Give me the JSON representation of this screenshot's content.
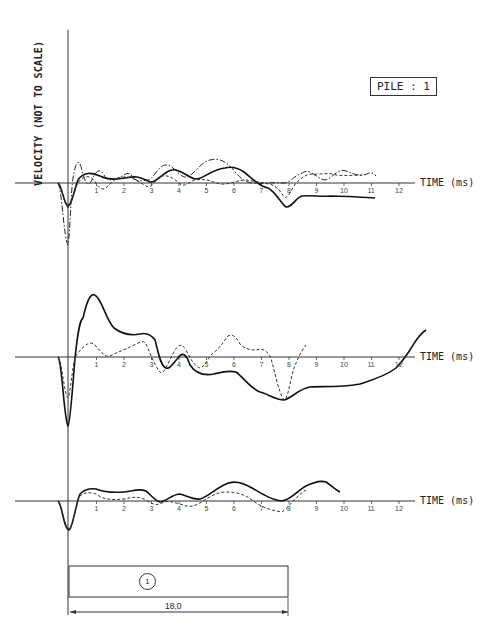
{
  "y_axis_label": "VELOCITY (NOT TO SCALE)",
  "pile_label": "PILE : 1",
  "x_axis_label": "TIME (ms)",
  "ticks": [
    "1",
    "2",
    "3",
    "4",
    "5",
    "6",
    "7",
    "8",
    "9",
    "10",
    "11",
    "12"
  ],
  "pile_diagram": {
    "number": "1",
    "length": "18,0"
  },
  "chart_data": [
    {
      "type": "line",
      "title": "Trace group 1 (top)",
      "xlabel": "TIME (ms)",
      "ylabel": "VELOCITY (NOT TO SCALE)",
      "xlim": [
        0,
        13
      ],
      "x_ticks": [
        1,
        2,
        3,
        4,
        5,
        6,
        7,
        8,
        9,
        10,
        11,
        12
      ],
      "grid": false,
      "series": [
        {
          "name": "solid",
          "style": "solid",
          "x": [
            -0.3,
            0,
            0.3,
            0.8,
            1.5,
            2,
            2.5,
            3.2,
            3.9,
            4.6,
            5.2,
            5.9,
            6.5,
            7,
            7.5,
            7.9,
            8.5,
            9,
            10,
            11
          ],
          "y": [
            0,
            -1.2,
            0,
            0.45,
            0.2,
            0.3,
            0.2,
            0.1,
            0.5,
            0.2,
            0.4,
            0.6,
            0.2,
            -0.1,
            -0.5,
            -0.8,
            -0.5,
            -0.55,
            -0.5,
            -0.55
          ]
        },
        {
          "name": "dash-dot",
          "style": "dashdot",
          "x": [
            -0.3,
            0,
            0.15,
            0.5,
            0.9,
            1.3,
            1.8,
            2.5,
            3.2,
            3.9,
            4.6,
            5.3,
            5.9,
            6.5,
            7,
            8,
            9,
            10,
            10.8
          ],
          "y": [
            0,
            -2.5,
            0,
            1.1,
            0.2,
            0.5,
            0.3,
            0.35,
            0.05,
            0.45,
            0.1,
            0.45,
            0.7,
            0.3,
            0,
            0,
            0.35,
            0.25,
            0.3
          ]
        },
        {
          "name": "dashed",
          "style": "dashed",
          "x": [
            -0.3,
            0,
            0.4,
            0.9,
            1.4,
            2,
            2.6,
            3.2,
            3.9,
            4.6,
            5.3,
            6,
            6.7,
            7.3,
            7.8,
            8.3,
            9,
            10,
            10.8
          ],
          "y": [
            0,
            -1,
            0,
            0.3,
            -0.15,
            0.35,
            0.3,
            -0.1,
            0.3,
            -0.05,
            0.3,
            0.2,
            0,
            0,
            -0.6,
            0.2,
            0.4,
            0.3,
            0.35
          ]
        }
      ]
    },
    {
      "type": "line",
      "title": "Trace group 2 (middle)",
      "xlabel": "TIME (ms)",
      "xlim": [
        0,
        13
      ],
      "x_ticks": [
        1,
        2,
        3,
        4,
        5,
        6,
        7,
        8,
        9,
        10,
        11,
        12
      ],
      "grid": false,
      "series": [
        {
          "name": "solid",
          "style": "solid",
          "x": [
            -0.3,
            0,
            0.4,
            0.8,
            1.3,
            1.8,
            2.5,
            3.1,
            3.7,
            4.2,
            5,
            5.9,
            6.5,
            7.2,
            7.8,
            8.5,
            9.5,
            10.5,
            11.5,
            12,
            12.4,
            12.8
          ],
          "y": [
            0,
            -3.3,
            1.5,
            2.2,
            1.5,
            0.9,
            0.8,
            -0.4,
            0.2,
            -0.6,
            -0.7,
            -0.4,
            -1,
            -1.4,
            -1.6,
            -0.8,
            -0.85,
            -0.7,
            -0.3,
            0,
            0.5,
            0.9
          ]
        },
        {
          "name": "dashed",
          "style": "dashed",
          "x": [
            -0.3,
            0,
            0.4,
            0.9,
            1.4,
            2,
            2.6,
            3.2,
            3.9,
            4.6,
            5.2,
            6,
            6.7,
            7.3,
            7.8,
            8.3,
            8.7
          ],
          "y": [
            0,
            -1.9,
            0,
            0.5,
            -0.1,
            0.1,
            0.6,
            -0.6,
            0.7,
            -0.4,
            0.2,
            0.95,
            0.15,
            0.15,
            -1.2,
            0,
            0.7
          ]
        }
      ]
    },
    {
      "type": "line",
      "title": "Trace group 3 (bottom)",
      "xlabel": "TIME (ms)",
      "xlim": [
        0,
        13
      ],
      "x_ticks": [
        1,
        2,
        3,
        4,
        5,
        6,
        7,
        8,
        9,
        10,
        11,
        12
      ],
      "grid": false,
      "series": [
        {
          "name": "solid",
          "style": "solid",
          "x": [
            -0.3,
            0,
            0.5,
            1,
            1.5,
            2.5,
            3.2,
            3.8,
            4.6,
            5.2,
            6,
            6.8,
            7.5,
            8,
            8.6,
            9.2,
            9.6,
            10
          ],
          "y": [
            0,
            -1,
            0.25,
            0.35,
            0.25,
            0.3,
            -0.05,
            0.2,
            0.05,
            0.3,
            0.7,
            0.4,
            0.05,
            0,
            0.45,
            0.7,
            0.65,
            0.5
          ]
        },
        {
          "name": "dashed",
          "style": "dashed",
          "x": [
            -0.3,
            0,
            0.5,
            1,
            1.5,
            2.5,
            3.3,
            4,
            4.7,
            5.2,
            6,
            6.8,
            7.5,
            8,
            8.5,
            9.2
          ],
          "y": [
            0,
            -0.95,
            0.2,
            0.25,
            0.05,
            0.15,
            -0.1,
            0.05,
            -0.2,
            0.15,
            0.35,
            0.2,
            -0.2,
            -0.4,
            0,
            0.45
          ]
        }
      ]
    }
  ]
}
